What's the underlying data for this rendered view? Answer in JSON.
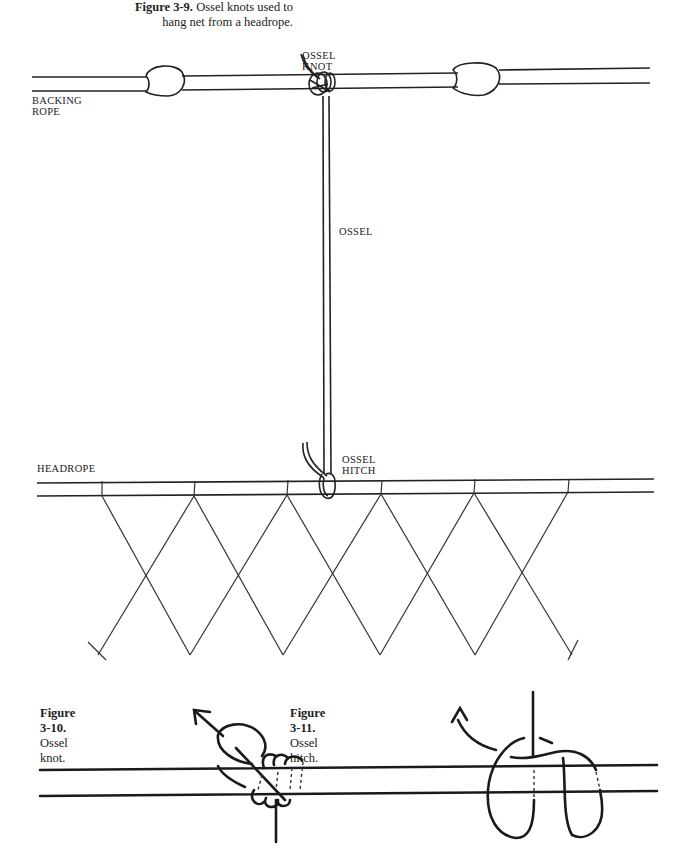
{
  "figure_3_9": {
    "caption_bold": "Figure 3-9.",
    "caption_line1": " Ossel knots used to",
    "caption_line2": "hang net from a headrope.",
    "labels": {
      "ossel_knot": "OSSEL KNOT",
      "backing_rope": "BACKING ROPE",
      "ossel": "OSSEL",
      "ossel_hitch": "OSSEL HITCH",
      "headrope": "HEADROPE"
    },
    "net_knots_x": [
      102,
      195,
      288,
      380,
      474,
      568
    ],
    "net_bottom_x": [
      98,
      190,
      283,
      380,
      475,
      572
    ]
  },
  "figure_3_10": {
    "caption_bold": "Figure 3-10.",
    "caption_text": " Ossel knot."
  },
  "figure_3_11": {
    "caption_bold": "Figure 3-11.",
    "caption_text": " Ossel hitch."
  },
  "colors": {
    "ink": "#222222",
    "background": "#ffffff"
  }
}
